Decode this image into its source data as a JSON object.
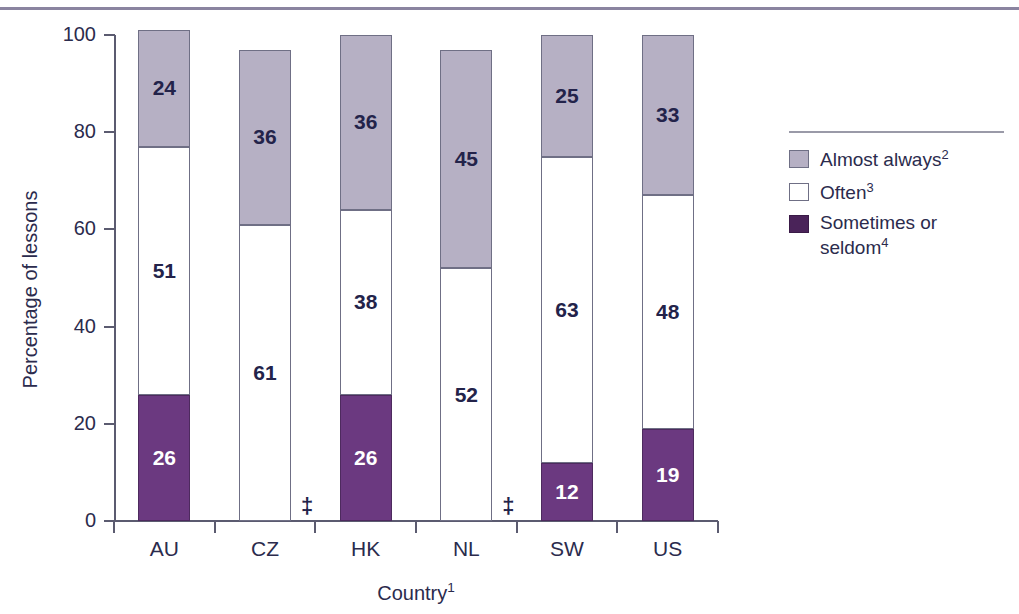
{
  "chart_data": {
    "type": "bar",
    "subtype": "stacked-vertical-100",
    "title": "",
    "xlabel": "Country",
    "xlabel_footnote": "1",
    "ylabel": "Percentage of lessons",
    "ylim": [
      0,
      100
    ],
    "yticks": [
      0,
      20,
      40,
      60,
      80,
      100
    ],
    "grid": false,
    "legend_position": "right",
    "categories": [
      "AU",
      "CZ",
      "HK",
      "NL",
      "SW",
      "US"
    ],
    "series": [
      {
        "name": "Sometimes or seldom",
        "footnote": "4",
        "color": "#6b3980",
        "values": [
          26,
          null,
          26,
          null,
          12,
          19
        ],
        "labels": [
          "26",
          "‡",
          "26",
          "‡",
          "12",
          "19"
        ]
      },
      {
        "name": "Often",
        "footnote": "3",
        "color": "#ffffff",
        "values": [
          51,
          61,
          38,
          52,
          63,
          48
        ],
        "labels": [
          "51",
          "61",
          "38",
          "52",
          "63",
          "48"
        ]
      },
      {
        "name": "Almost always",
        "footnote": "2",
        "color": "#b6b0c4",
        "values": [
          24,
          36,
          36,
          45,
          25,
          33
        ],
        "labels": [
          "24",
          "36",
          "36",
          "45",
          "25",
          "33"
        ]
      }
    ],
    "totals": [
      101,
      97,
      100,
      97,
      100,
      100
    ],
    "suppressed_marker": "‡",
    "suppressed_categories": [
      "CZ",
      "NL"
    ]
  },
  "axes": {
    "y_title": "Percentage of lessons",
    "y_ticks": [
      "100",
      "80",
      "60",
      "40",
      "20",
      "0"
    ],
    "x_title": "Country",
    "x_title_footnote": "1",
    "x_labels": [
      "AU",
      "CZ",
      "HK",
      "NL",
      "SW",
      "US"
    ]
  },
  "legend": {
    "items": [
      {
        "label": "Almost always",
        "footnote": "2",
        "swatch": "almost-always-swatch"
      },
      {
        "label": "Often",
        "footnote": "3",
        "swatch": "often-swatch"
      },
      {
        "label": "Sometimes or seldom",
        "footnote": "4",
        "swatch": "sometimes-or-seldom-swatch"
      }
    ]
  },
  "colors": {
    "almost_always": "#b6b0c4",
    "often": "#ffffff",
    "sometimes_or_seldom": "#6b3980",
    "rule": "#8a84a0",
    "axis": "#5b5b70",
    "text": "#2b2b4d"
  }
}
